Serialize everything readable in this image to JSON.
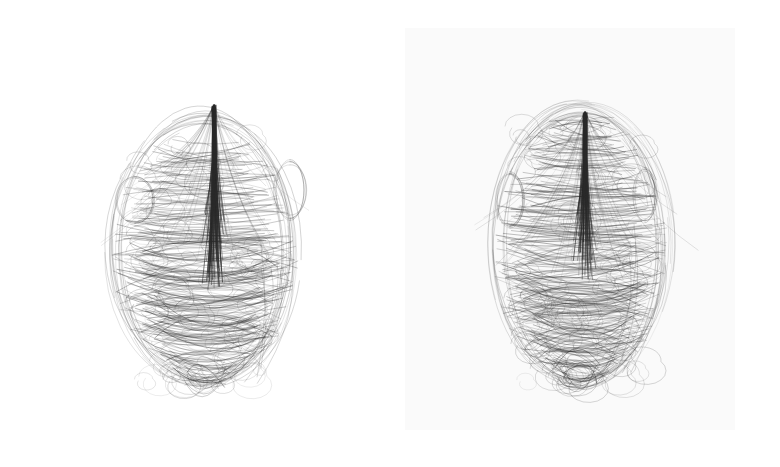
{
  "image": {
    "width": 780,
    "height": 467,
    "background": "#ffffff",
    "description": "Two side-by-side scribble-line pen portraits of a face on white paper"
  },
  "panels": [
    {
      "id": "left",
      "paper": null,
      "drawing": {
        "center_x": 205,
        "center_y": 250,
        "radius_x": 85,
        "radius_y": 130,
        "top_y": 105,
        "bottom_y": 375,
        "nose_line": {
          "x": 214,
          "y1": 105,
          "y2": 250,
          "width": 4
        },
        "ears": [
          {
            "cx": 135,
            "cy": 200,
            "rx": 22,
            "ry": 24
          },
          {
            "cx": 290,
            "cy": 190,
            "rx": 16,
            "ry": 28
          }
        ],
        "stroke_color": "#2a2a2a",
        "stroke_count": 260,
        "seed": 7
      }
    },
    {
      "id": "right",
      "paper": {
        "x": 15,
        "y": 28,
        "width": 330,
        "height": 402,
        "color": "#fafafa"
      },
      "drawing": {
        "center_x": 580,
        "center_y": 245,
        "radius_x": 80,
        "radius_y": 135,
        "top_y": 95,
        "bottom_y": 375,
        "nose_line": {
          "x": 585,
          "y1": 112,
          "y2": 240,
          "width": 4
        },
        "ears": [
          {
            "cx": 510,
            "cy": 200,
            "rx": 14,
            "ry": 28
          },
          {
            "cx": 645,
            "cy": 195,
            "rx": 12,
            "ry": 26
          }
        ],
        "stroke_color": "#2a2a2a",
        "stroke_count": 280,
        "seed": 13
      }
    }
  ]
}
